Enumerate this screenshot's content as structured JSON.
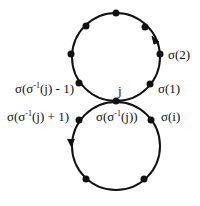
{
  "diagram": {
    "colors": {
      "stroke": "#111111",
      "background": "#ffffff"
    },
    "upper_cycle": {
      "center": [
        116,
        57
      ],
      "radius": 45,
      "arrow_direction": "up (counterclockwise on right side)",
      "labels": {
        "sigma_2": "σ(2)",
        "sigma_1": "σ(1)",
        "pred_prefix": "σ(σ",
        "pred_sup": "-1",
        "pred_suffix": "(j) - 1)"
      }
    },
    "junction": {
      "label": "j",
      "below_label_prefix": "σ(σ",
      "below_label_sup": "-1",
      "below_label_suffix": "(j))"
    },
    "lower_cycle": {
      "center": [
        116,
        146
      ],
      "radius": 44,
      "arrow_direction": "down on left side",
      "labels": {
        "sigma_i": "σ(i)",
        "succ_prefix": "σ(σ",
        "succ_sup": "-1",
        "succ_suffix": "(j) + 1)"
      }
    }
  }
}
